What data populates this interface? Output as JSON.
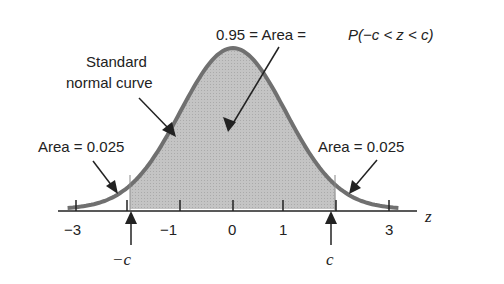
{
  "chart_data": {
    "type": "area",
    "title": "0.95 = Area = P(−c < z < c)",
    "xlabel": "z",
    "ylabel": "",
    "xlim": [
      -3.2,
      3.2
    ],
    "x_ticks": [
      -3,
      -2,
      -1,
      0,
      1,
      2,
      3
    ],
    "x_tick_labels": [
      "−3",
      "−1",
      "0",
      "1",
      "3"
    ],
    "curve": "standard normal density",
    "shaded_region": {
      "from": -1.96,
      "to": 1.96,
      "area": 0.95
    },
    "tail_areas": [
      {
        "side": "left",
        "area": 0.025
      },
      {
        "side": "right",
        "area": 0.025
      }
    ],
    "critical_values": {
      "lower": "−c",
      "upper": "c",
      "value": 1.96
    },
    "annotations": [
      "0.95 = Area = P(−c < z < c)",
      "Standard normal curve",
      "Area = 0.025",
      "Area = 0.025"
    ]
  },
  "labels": {
    "title_left": "0.95 = Area = ",
    "title_right": "P(−c < z < c)",
    "curve_line1": "Standard",
    "curve_line2": "normal curve",
    "left_area": "Area = 0.025",
    "right_area": "Area = 0.025",
    "axis_var": "z",
    "neg_c": "−c",
    "pos_c": "c",
    "ticks": {
      "m3": "−3",
      "m1": "−1",
      "zero": "0",
      "p1": "1",
      "p3": "3"
    }
  }
}
